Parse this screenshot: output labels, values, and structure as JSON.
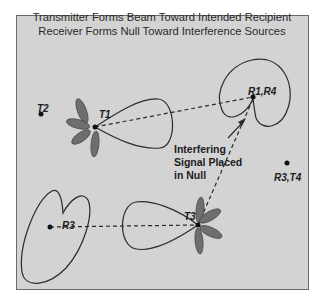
{
  "title": {
    "line1": "Transmitter Forms Beam Toward Intended Recipient",
    "line2": "Receiver Forms Null Toward Interference Sources"
  },
  "nodes": {
    "t1": "T1",
    "t2": "T2",
    "t3": "T3",
    "r1r4": "R1,R4",
    "r3": "R3",
    "r3t4": "R3,T4"
  },
  "annotation": {
    "line1": "Interfering",
    "line2": "Signal Placed",
    "line3": "in Null"
  },
  "colors": {
    "background": "#d3d3d3",
    "frame_border": "#6a6a6a",
    "pattern_stroke": "#2a2a2a",
    "sidelobe_fill": "#6e6e6e"
  }
}
